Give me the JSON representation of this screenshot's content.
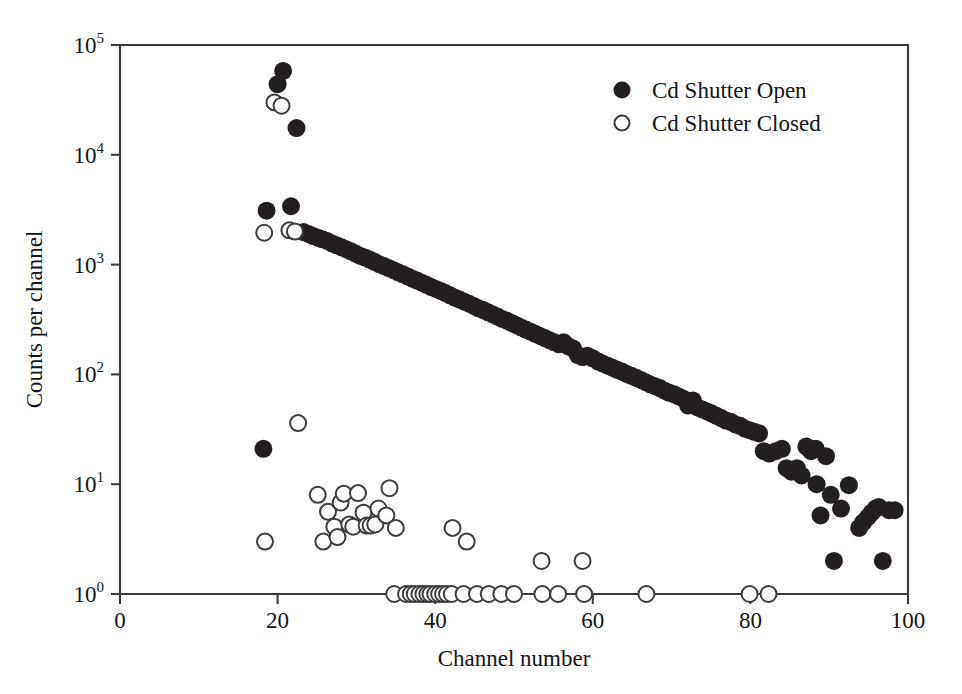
{
  "figure": {
    "background": "#ffffff",
    "ink_color": "#231f20",
    "axis_color": "#3a3a3a"
  },
  "chart_data": {
    "type": "scatter",
    "title": "",
    "xlabel": "Channel number",
    "ylabel": "Counts per channel",
    "xlim": [
      0,
      100
    ],
    "ylim": [
      1,
      100000
    ],
    "yscale": "log",
    "xscale": "linear",
    "grid": false,
    "xticks": [
      0,
      20,
      40,
      60,
      80,
      100
    ],
    "xtick_labels": [
      "0",
      "20",
      "40",
      "60",
      "80",
      "100"
    ],
    "yticks": [
      1,
      10,
      100,
      1000,
      10000,
      100000
    ],
    "ytick_labels": [
      "10⁰",
      "10¹",
      "10²",
      "10³",
      "10⁴",
      "10⁵"
    ],
    "ytick_mantissa": "10",
    "ytick_exponents": [
      "0",
      "1",
      "2",
      "3",
      "4",
      "5"
    ],
    "legend": {
      "position": "upper-right-inside",
      "entries": [
        {
          "name": "Cd Shutter Open",
          "marker": "filled-circle",
          "color": "#231f20"
        },
        {
          "name": "Cd Shutter Closed",
          "marker": "open-circle",
          "color": "#ffffff"
        }
      ]
    },
    "series": [
      {
        "name": "Cd Shutter Open",
        "marker": "filled-circle",
        "color": "#231f20",
        "points": [
          [
            18.2,
            21
          ],
          [
            18.6,
            3100
          ],
          [
            20.0,
            44000
          ],
          [
            20.7,
            58000
          ],
          [
            21.7,
            3400
          ],
          [
            22.4,
            17500
          ],
          [
            23.3,
            1980
          ],
          [
            23.9,
            1900
          ],
          [
            24.5,
            1820
          ],
          [
            25.1,
            1760
          ],
          [
            25.7,
            1700
          ],
          [
            26.3,
            1640
          ],
          [
            26.9,
            1560
          ],
          [
            27.5,
            1500
          ],
          [
            28.1,
            1440
          ],
          [
            28.7,
            1380
          ],
          [
            29.3,
            1320
          ],
          [
            29.9,
            1260
          ],
          [
            30.5,
            1200
          ],
          [
            31.1,
            1160
          ],
          [
            31.7,
            1110
          ],
          [
            32.3,
            1060
          ],
          [
            32.9,
            1010
          ],
          [
            33.5,
            970
          ],
          [
            34.1,
            930
          ],
          [
            34.7,
            890
          ],
          [
            35.3,
            850
          ],
          [
            35.9,
            815
          ],
          [
            36.5,
            780
          ],
          [
            37.1,
            745
          ],
          [
            37.7,
            715
          ],
          [
            38.3,
            685
          ],
          [
            38.9,
            655
          ],
          [
            39.5,
            625
          ],
          [
            40.1,
            600
          ],
          [
            40.7,
            575
          ],
          [
            41.3,
            550
          ],
          [
            41.9,
            525
          ],
          [
            42.5,
            500
          ],
          [
            43.1,
            480
          ],
          [
            43.7,
            460
          ],
          [
            44.3,
            440
          ],
          [
            44.9,
            420
          ],
          [
            45.5,
            400
          ],
          [
            46.1,
            385
          ],
          [
            46.7,
            368
          ],
          [
            47.3,
            352
          ],
          [
            47.9,
            336
          ],
          [
            48.5,
            320
          ],
          [
            49.1,
            308
          ],
          [
            49.7,
            294
          ],
          [
            50.3,
            281
          ],
          [
            50.9,
            268
          ],
          [
            51.5,
            256
          ],
          [
            52.1,
            245
          ],
          [
            52.7,
            234
          ],
          [
            53.3,
            224
          ],
          [
            53.9,
            214
          ],
          [
            54.5,
            205
          ],
          [
            55.1,
            196
          ],
          [
            55.7,
            188
          ],
          [
            56.3,
            196
          ],
          [
            56.9,
            180
          ],
          [
            57.5,
            172
          ],
          [
            58.1,
            150
          ],
          [
            58.7,
            144
          ],
          [
            59.3,
            148
          ],
          [
            60.0,
            140
          ],
          [
            60.7,
            131
          ],
          [
            61.3,
            125
          ],
          [
            61.9,
            120
          ],
          [
            62.5,
            115
          ],
          [
            63.1,
            110
          ],
          [
            63.7,
            106
          ],
          [
            64.3,
            101
          ],
          [
            64.9,
            97
          ],
          [
            65.5,
            93
          ],
          [
            66.1,
            89
          ],
          [
            66.7,
            85
          ],
          [
            67.3,
            81
          ],
          [
            67.9,
            78
          ],
          [
            68.5,
            75
          ],
          [
            69.1,
            71
          ],
          [
            69.7,
            68
          ],
          [
            70.3,
            66
          ],
          [
            70.9,
            63
          ],
          [
            71.5,
            60
          ],
          [
            72.1,
            52
          ],
          [
            72.7,
            58
          ],
          [
            73.3,
            50
          ],
          [
            73.9,
            48
          ],
          [
            74.5,
            46
          ],
          [
            75.1,
            44
          ],
          [
            75.7,
            42
          ],
          [
            76.3,
            40
          ],
          [
            76.9,
            38
          ],
          [
            77.5,
            37
          ],
          [
            78.1,
            35
          ],
          [
            78.7,
            34
          ],
          [
            79.3,
            32
          ],
          [
            79.9,
            31
          ],
          [
            80.5,
            30
          ],
          [
            81.1,
            29
          ],
          [
            81.7,
            20
          ],
          [
            82.4,
            19
          ],
          [
            83.2,
            20
          ],
          [
            84.0,
            21
          ],
          [
            84.6,
            14
          ],
          [
            85.2,
            13
          ],
          [
            85.9,
            14
          ],
          [
            86.5,
            12
          ],
          [
            87.1,
            22
          ],
          [
            87.7,
            20
          ],
          [
            88.3,
            21
          ],
          [
            88.4,
            10
          ],
          [
            88.9,
            5.2
          ],
          [
            89.6,
            18
          ],
          [
            90.2,
            8
          ],
          [
            90.6,
            2
          ],
          [
            91.5,
            6
          ],
          [
            92.5,
            9.8
          ],
          [
            93.8,
            4
          ],
          [
            94.3,
            4.5
          ],
          [
            94.9,
            5
          ],
          [
            95.4,
            5.5
          ],
          [
            95.9,
            6
          ],
          [
            96.3,
            6.2
          ],
          [
            96.8,
            2
          ],
          [
            97.6,
            5.8
          ],
          [
            98.3,
            5.8
          ]
        ]
      },
      {
        "name": "Cd Shutter Closed",
        "marker": "open-circle",
        "color": "#ffffff",
        "points": [
          [
            18.3,
            1950
          ],
          [
            18.4,
            3.0
          ],
          [
            19.6,
            30000
          ],
          [
            20.5,
            28000
          ],
          [
            21.5,
            2050
          ],
          [
            22.2,
            2000
          ],
          [
            22.6,
            36
          ],
          [
            25.1,
            8.0
          ],
          [
            25.8,
            3.0
          ],
          [
            26.4,
            5.6
          ],
          [
            27.2,
            4.1
          ],
          [
            27.6,
            3.3
          ],
          [
            28.0,
            6.8
          ],
          [
            28.4,
            8.2
          ],
          [
            29.1,
            4.3
          ],
          [
            29.6,
            4.1
          ],
          [
            30.2,
            8.3
          ],
          [
            30.9,
            5.5
          ],
          [
            31.3,
            4.2
          ],
          [
            31.8,
            4.2
          ],
          [
            32.4,
            4.3
          ],
          [
            32.8,
            6.0
          ],
          [
            33.8,
            5.2
          ],
          [
            34.2,
            9.2
          ],
          [
            35.0,
            4.0
          ],
          [
            34.8,
            1
          ],
          [
            36.3,
            1
          ],
          [
            36.9,
            1
          ],
          [
            37.4,
            1
          ],
          [
            38.0,
            1
          ],
          [
            38.5,
            1
          ],
          [
            39.0,
            1
          ],
          [
            39.4,
            1
          ],
          [
            40.0,
            1
          ],
          [
            40.5,
            1
          ],
          [
            41.0,
            1
          ],
          [
            41.5,
            1
          ],
          [
            42.1,
            1
          ],
          [
            43.6,
            1
          ],
          [
            44.0,
            3.0
          ],
          [
            45.3,
            1
          ],
          [
            46.8,
            1
          ],
          [
            48.4,
            1
          ],
          [
            50.0,
            1
          ],
          [
            53.5,
            2.0
          ],
          [
            53.6,
            1
          ],
          [
            55.6,
            1
          ],
          [
            58.7,
            2.0
          ],
          [
            58.9,
            1
          ],
          [
            66.8,
            1
          ],
          [
            79.9,
            1
          ],
          [
            82.3,
            1
          ],
          [
            42.2,
            4.0
          ]
        ]
      }
    ]
  }
}
